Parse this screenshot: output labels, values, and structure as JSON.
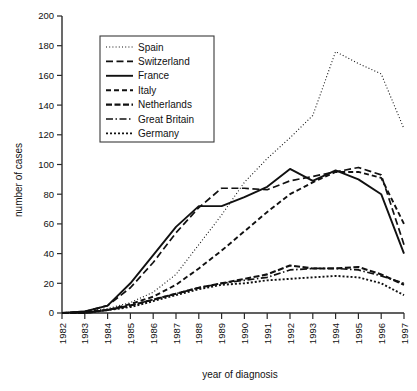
{
  "chart_data": {
    "type": "line",
    "title": "",
    "xlabel": "year of diagnosis",
    "ylabel": "number of cases",
    "x": [
      1982,
      1983,
      1984,
      1985,
      1986,
      1987,
      1988,
      1989,
      1990,
      1991,
      1992,
      1993,
      1994,
      1995,
      1996,
      1997
    ],
    "categories": [
      "1982",
      "1983",
      "1984",
      "1985",
      "1986",
      "1987",
      "1988",
      "1989",
      "1990",
      "1991",
      "1992",
      "1993",
      "1994",
      "1995",
      "1996",
      "1997"
    ],
    "xlim": [
      1982,
      1997
    ],
    "ylim": [
      0,
      200
    ],
    "ytick_step": 20,
    "yticks": [
      0,
      20,
      40,
      60,
      80,
      100,
      120,
      140,
      160,
      180,
      200
    ],
    "grid": false,
    "legend_position": "upper-left-inset",
    "series": [
      {
        "name": "Spain",
        "style": "dotted-fine",
        "dash": "1,2.2",
        "width": 1.1,
        "values": [
          0,
          1,
          3,
          7,
          14,
          26,
          46,
          66,
          88,
          104,
          118,
          133,
          176,
          168,
          161,
          124
        ]
      },
      {
        "name": "Switzerland",
        "style": "dashed-long",
        "dash": "7,3.5",
        "width": 1.7,
        "values": [
          0,
          1,
          5,
          17,
          34,
          54,
          71,
          84,
          84,
          83,
          89,
          92,
          95,
          98,
          93,
          46
        ]
      },
      {
        "name": "France",
        "style": "solid",
        "dash": "none",
        "width": 1.9,
        "values": [
          0,
          1,
          5,
          20,
          39,
          58,
          72,
          72,
          78,
          85,
          97,
          89,
          96,
          90,
          80,
          40
        ]
      },
      {
        "name": "Italy",
        "style": "dashed-medium",
        "dash": "5,3",
        "width": 1.9,
        "values": [
          0,
          1,
          2,
          6,
          11,
          19,
          30,
          42,
          55,
          68,
          80,
          88,
          95,
          95,
          91,
          60
        ]
      },
      {
        "name": "Netherlands",
        "style": "dashed-thick",
        "dash": "6,2.5",
        "width": 2.1,
        "values": [
          0,
          0,
          2,
          5,
          9,
          13,
          17,
          20,
          23,
          26,
          32,
          30,
          30,
          31,
          26,
          19
        ]
      },
      {
        "name": "Great Britain",
        "style": "dash-dot",
        "dash": "7,2.5,1.5,2.5",
        "width": 1.7,
        "values": [
          0,
          0,
          2,
          5,
          9,
          13,
          17,
          20,
          22,
          24,
          29,
          30,
          30,
          29,
          25,
          20
        ]
      },
      {
        "name": "Germany",
        "style": "dotted-medium",
        "dash": "2,2",
        "width": 1.9,
        "values": [
          0,
          0,
          2,
          4,
          8,
          12,
          16,
          19,
          20,
          22,
          23,
          24,
          25,
          24,
          20,
          12
        ]
      }
    ]
  },
  "legend": {
    "entries": [
      {
        "label": "Spain"
      },
      {
        "label": "Switzerland"
      },
      {
        "label": "France"
      },
      {
        "label": "Italy"
      },
      {
        "label": "Netherlands"
      },
      {
        "label": "Great Britain"
      },
      {
        "label": "Germany"
      }
    ]
  }
}
